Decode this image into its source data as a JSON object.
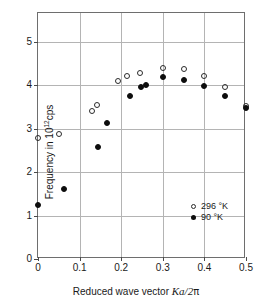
{
  "chart_data": {
    "type": "scatter",
    "title": "",
    "xlabel": "Reduced wave vector Ka/2π",
    "xlabel_parts": {
      "prefix": "Reduced wave vector ",
      "symbol": "Ka",
      "div": "/2",
      "pi": "π"
    },
    "ylabel": "Frequency in 10^12 cps",
    "ylabel_parts": {
      "prefix": "Frequency in 10",
      "exponent": "12",
      "suffix": "cps"
    },
    "xlim": [
      0,
      0.5
    ],
    "ylim": [
      0,
      5.66
    ],
    "xticks": [
      0,
      0.1,
      0.2,
      0.3,
      0.4,
      0.5
    ],
    "xtick_labels": [
      "0",
      "0.1",
      "0.2",
      "0.3",
      "0.4",
      "0.5"
    ],
    "yticks": [
      0,
      1,
      2,
      3,
      4,
      5
    ],
    "ytick_labels": [
      "0",
      "1",
      "2",
      "3",
      "4",
      "5"
    ],
    "grid": true,
    "legend_position": "inside-lower-right",
    "series": [
      {
        "name": "296 °K",
        "marker": "open-circle",
        "color": "#2b2b2b",
        "points": [
          {
            "x": 0.0,
            "y": 2.78
          },
          {
            "x": 0.05,
            "y": 2.87
          },
          {
            "x": 0.131,
            "y": 3.4
          },
          {
            "x": 0.142,
            "y": 3.55
          },
          {
            "x": 0.193,
            "y": 4.1
          },
          {
            "x": 0.215,
            "y": 4.22
          },
          {
            "x": 0.245,
            "y": 4.28
          },
          {
            "x": 0.3,
            "y": 4.4
          },
          {
            "x": 0.35,
            "y": 4.38
          },
          {
            "x": 0.4,
            "y": 4.22
          },
          {
            "x": 0.45,
            "y": 3.96
          },
          {
            "x": 0.5,
            "y": 3.52
          }
        ]
      },
      {
        "name": "90 °K",
        "marker": "filled-circle",
        "color": "#0d0d0d",
        "points": [
          {
            "x": 0.0,
            "y": 1.25
          },
          {
            "x": 0.063,
            "y": 1.62
          },
          {
            "x": 0.145,
            "y": 2.57
          },
          {
            "x": 0.167,
            "y": 3.12
          },
          {
            "x": 0.22,
            "y": 3.76
          },
          {
            "x": 0.248,
            "y": 3.96
          },
          {
            "x": 0.26,
            "y": 4.0
          },
          {
            "x": 0.3,
            "y": 4.18
          },
          {
            "x": 0.35,
            "y": 4.12
          },
          {
            "x": 0.4,
            "y": 3.97
          },
          {
            "x": 0.45,
            "y": 3.75
          },
          {
            "x": 0.5,
            "y": 3.47
          }
        ]
      }
    ]
  },
  "legend": {
    "items": [
      {
        "label": "296 °K",
        "marker": "open-circle"
      },
      {
        "label": "90 °K",
        "marker": "filled-circle"
      }
    ]
  }
}
